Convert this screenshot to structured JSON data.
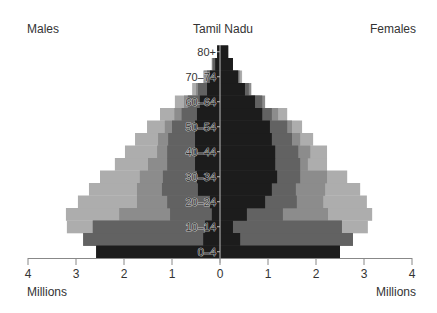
{
  "labels": {
    "left_title": "Males",
    "center_title": "Tamil Nadu",
    "right_title": "Females",
    "left_unit": "Millions",
    "right_unit": "Millions"
  },
  "chart_data": {
    "type": "bar",
    "subtype": "population-pyramid",
    "title": "Tamil Nadu",
    "xlabel_left": "Millions",
    "xlabel_right": "Millions",
    "left_group": "Males",
    "right_group": "Females",
    "xlim": [
      0,
      4
    ],
    "xticks": [
      4,
      3,
      2,
      1,
      0,
      1,
      2,
      3,
      4
    ],
    "categories": [
      "0–4",
      "5–9",
      "10–14",
      "15–19",
      "20–24",
      "25–29",
      "30–34",
      "35–39",
      "40–44",
      "45–49",
      "50–54",
      "55–59",
      "60–64",
      "65–69",
      "70–74",
      "75–79",
      "80+"
    ],
    "visible_category_labels": [
      "0–4",
      "10–14",
      "20–24",
      "30–34",
      "40–44",
      "50–54",
      "60–64",
      "70–74",
      "80+"
    ],
    "grid": false,
    "legend": "none",
    "series": [
      {
        "name": "layer-1 (outer, light gray)",
        "color": "#adadad",
        "males": [
          2.58,
          2.85,
          3.19,
          3.21,
          2.96,
          2.73,
          2.5,
          2.19,
          1.98,
          1.77,
          1.52,
          1.25,
          0.94,
          0.58,
          0.35,
          0.17,
          0.06
        ],
        "females": [
          2.5,
          2.77,
          3.08,
          3.17,
          3.06,
          2.92,
          2.65,
          2.23,
          2.23,
          1.94,
          1.71,
          1.4,
          0.83,
          0.65,
          0.46,
          0.27,
          0.17
        ]
      },
      {
        "name": "layer-2 (medium-light gray)",
        "color": "#8c8c8c",
        "males": [
          2.58,
          2.85,
          2.65,
          2.1,
          1.73,
          1.73,
          1.67,
          1.5,
          1.31,
          1.29,
          1.15,
          0.95,
          0.75,
          0.5,
          0.33,
          0.17,
          0.06
        ],
        "females": [
          2.5,
          2.77,
          2.54,
          2.25,
          2.15,
          2.19,
          2.23,
          1.83,
          1.88,
          1.67,
          1.5,
          1.21,
          0.94,
          0.65,
          0.42,
          0.27,
          0.17
        ]
      },
      {
        "name": "layer-3 (medium-dark gray)",
        "color": "#626262",
        "males": [
          2.58,
          2.85,
          2.65,
          1.04,
          1.1,
          1.21,
          1.19,
          1.1,
          1.1,
          1.08,
          1.0,
          0.8,
          0.67,
          0.46,
          0.27,
          0.15,
          0.06
        ],
        "females": [
          2.5,
          2.77,
          2.54,
          1.31,
          1.6,
          1.58,
          1.67,
          1.67,
          1.63,
          1.5,
          1.4,
          1.08,
          0.88,
          0.6,
          0.38,
          0.27,
          0.17
        ]
      },
      {
        "name": "layer-4 (inner, near-black)",
        "color": "#1c1c1c",
        "males": [
          2.58,
          0.35,
          0.31,
          0.17,
          0.21,
          0.46,
          0.48,
          0.52,
          0.52,
          0.52,
          0.52,
          0.48,
          0.42,
          0.27,
          0.21,
          0.1,
          0.06
        ],
        "females": [
          2.5,
          0.42,
          0.27,
          0.56,
          0.94,
          1.08,
          1.19,
          1.15,
          1.15,
          1.08,
          1.04,
          0.88,
          0.73,
          0.52,
          0.38,
          0.27,
          0.17
        ]
      }
    ],
    "axis_color": "#888888"
  }
}
